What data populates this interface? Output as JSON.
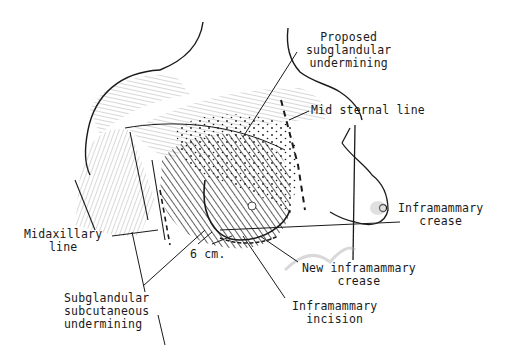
{
  "figure": {
    "background": "#ffffff",
    "ink": "#1a1a1a",
    "labels": {
      "proposed_subglandular": [
        "Proposed",
        "subglandular",
        "undermining"
      ],
      "midsternal_line": [
        "Mid sternal line"
      ],
      "inframammary_crease": [
        "Inframammary",
        "crease"
      ],
      "midaxillary_line": [
        "Midaxillary",
        "line"
      ],
      "six_cm": [
        "6 cm."
      ],
      "new_inframammary_crease": [
        "New inframammary",
        "crease"
      ],
      "inframammary_incision": [
        "Inframammary",
        "incision"
      ],
      "subglandular_subcutaneous": [
        "Subglandular",
        "subcutaneous",
        "undermining"
      ]
    }
  }
}
